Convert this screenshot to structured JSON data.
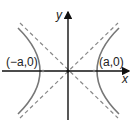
{
  "diagram": {
    "type": "hyperbola",
    "axes": {
      "x_label": "x",
      "y_label": "y"
    },
    "vertices": {
      "left": "(−a,0)",
      "right": "(a,0)"
    },
    "colors": {
      "axis": "#111111",
      "curve": "#777777",
      "asymptote": "#888888"
    }
  }
}
